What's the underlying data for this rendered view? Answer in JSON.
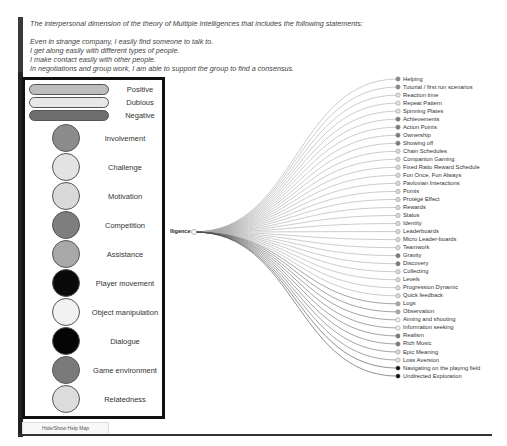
{
  "intro": {
    "heading": "The interpersonal dimension of the theory of Multiple Intelligences that includes the following statements:",
    "statements": [
      "Even in strange company, I easily find someone to talk to.",
      "I get along easily with different types of people.",
      "I make contact easily with other people.",
      "In negotiations and group work, I am able to support the group to find a consensus."
    ]
  },
  "legend": {
    "pills": [
      {
        "label": "Positive",
        "color": "#bdbdbd"
      },
      {
        "label": "Dubious",
        "color": "#e8e8e8"
      },
      {
        "label": "Negative",
        "color": "#6e6e6e"
      }
    ],
    "circles": [
      {
        "label": "Involvement",
        "color": "#8c8c8c"
      },
      {
        "label": "Challenge",
        "color": "#e3e3e3"
      },
      {
        "label": "Motivation",
        "color": "#d9d9d9"
      },
      {
        "label": "Competition",
        "color": "#7e7e7e"
      },
      {
        "label": "Assistance",
        "color": "#a8a8a8"
      },
      {
        "label": "Player movement",
        "color": "#0a0a0a"
      },
      {
        "label": "Object manipulation",
        "color": "#f2f2f2"
      },
      {
        "label": "Dialogue",
        "color": "#050505"
      },
      {
        "label": "Game environment",
        "color": "#7a7a7a"
      },
      {
        "label": "Relatedness",
        "color": "#dcdcdc"
      }
    ]
  },
  "tree": {
    "root_label": "lligence",
    "leaves": [
      {
        "label": "Helping",
        "color": "#8c8c8c"
      },
      {
        "label": "Tutorial / first run scenarios",
        "color": "#8c8c8c"
      },
      {
        "label": "Reaction time",
        "color": "#e3e3e3"
      },
      {
        "label": "Repeat Pattern",
        "color": "#e3e3e3"
      },
      {
        "label": "Spinning Plates",
        "color": "#e3e3e3"
      },
      {
        "label": "Achievements",
        "color": "#7e7e7e"
      },
      {
        "label": "Action Points",
        "color": "#7e7e7e"
      },
      {
        "label": "Ownership",
        "color": "#7e7e7e"
      },
      {
        "label": "Showing off",
        "color": "#7e7e7e"
      },
      {
        "label": "Chain Schedules",
        "color": "#d9d9d9"
      },
      {
        "label": "Companion Gaming",
        "color": "#d9d9d9"
      },
      {
        "label": "Fixed Ratio Reward Schedule",
        "color": "#d9d9d9"
      },
      {
        "label": "Fun Once, Fun Always",
        "color": "#d9d9d9"
      },
      {
        "label": "Pavlovian Interactions",
        "color": "#d9d9d9"
      },
      {
        "label": "Points",
        "color": "#d9d9d9"
      },
      {
        "label": "Protégé Effect",
        "color": "#d9d9d9"
      },
      {
        "label": "Rewards",
        "color": "#d9d9d9"
      },
      {
        "label": "Status",
        "color": "#d9d9d9"
      },
      {
        "label": "Identity",
        "color": "#dcdcdc"
      },
      {
        "label": "Leaderboards",
        "color": "#dcdcdc"
      },
      {
        "label": "Micro Leader-boards",
        "color": "#dcdcdc"
      },
      {
        "label": "Teamwork",
        "color": "#dcdcdc"
      },
      {
        "label": "Gravity",
        "color": "#7a7a7a"
      },
      {
        "label": "Discovery",
        "color": "#7a7a7a"
      },
      {
        "label": "Collecting",
        "color": "#dcdcdc"
      },
      {
        "label": "Levels",
        "color": "#dcdcdc"
      },
      {
        "label": "Progression Dynamic",
        "color": "#dcdcdc"
      },
      {
        "label": "Quick feedback",
        "color": "#dcdcdc"
      },
      {
        "label": "Logs",
        "color": "#a8a8a8"
      },
      {
        "label": "Observation",
        "color": "#a8a8a8"
      },
      {
        "label": "Aiming and shooting",
        "color": "#f2f2f2"
      },
      {
        "label": "Information seeking",
        "color": "#f2f2f2"
      },
      {
        "label": "Realism",
        "color": "#7a7a7a"
      },
      {
        "label": "Rich Music",
        "color": "#7a7a7a"
      },
      {
        "label": "Epic Meaning",
        "color": "#d9d9d9"
      },
      {
        "label": "Loss Aversion",
        "color": "#e3e3e3"
      },
      {
        "label": "Navigating on the playing field",
        "color": "#0a0a0a"
      },
      {
        "label": "Undirected Exploration",
        "color": "#0a0a0a"
      }
    ]
  },
  "controls": {
    "hide_show_label": "Hide/Show Help Map"
  }
}
